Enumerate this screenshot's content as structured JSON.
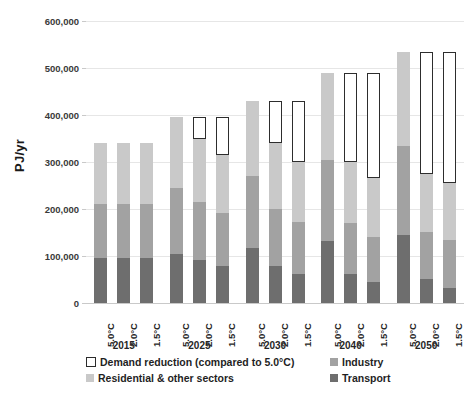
{
  "chart_data": {
    "type": "bar",
    "subtype": "stacked-bar-grouped",
    "title": "",
    "xlabel": "",
    "ylabel": "PJ/yr",
    "ylim": [
      0,
      600000
    ],
    "ytick_step": 100000,
    "ytick_labels": [
      "0",
      "100,000",
      "200,000",
      "300,000",
      "400,000",
      "500,000",
      "600,000"
    ],
    "ytick_values": [
      0,
      100000,
      200000,
      300000,
      400000,
      500000,
      600000
    ],
    "grid": true,
    "legend_position": "bottom",
    "legend": [
      "Demand reduction (compared to 5.0°C)",
      "Residential & other sectors",
      "Industry",
      "Transport"
    ],
    "series": [
      {
        "name": "Transport",
        "color": "#6e6e6e"
      },
      {
        "name": "Industry",
        "color": "#a2a2a2"
      },
      {
        "name": "Residential & other sectors",
        "color": "#c9c9c9"
      },
      {
        "name": "Demand reduction (compared to 5.0°C)",
        "color": "#ffffff"
      }
    ],
    "year_groups": [
      "2015",
      "2025",
      "2030",
      "2040",
      "2050"
    ],
    "scenarios": [
      "5.0°C",
      "2.0°C",
      "1.5°C"
    ],
    "bars": [
      {
        "year": "2015",
        "scenario": "5.0°C",
        "transport": 95000,
        "industry": 115000,
        "residential": 130000,
        "total": 340000,
        "reduction": 0
      },
      {
        "year": "2015",
        "scenario": "2.0°C",
        "transport": 95000,
        "industry": 115000,
        "residential": 130000,
        "total": 340000,
        "reduction": 0
      },
      {
        "year": "2015",
        "scenario": "1.5°C",
        "transport": 95000,
        "industry": 115000,
        "residential": 130000,
        "total": 340000,
        "reduction": 0
      },
      {
        "year": "2025",
        "scenario": "5.0°C",
        "transport": 105000,
        "industry": 140000,
        "residential": 150000,
        "total": 395000,
        "reduction": 0
      },
      {
        "year": "2025",
        "scenario": "2.0°C",
        "transport": 92000,
        "industry": 122000,
        "residential": 136000,
        "total": 350000,
        "reduction": 45000
      },
      {
        "year": "2025",
        "scenario": "1.5°C",
        "transport": 78000,
        "industry": 113000,
        "residential": 124000,
        "total": 315000,
        "reduction": 80000
      },
      {
        "year": "2030",
        "scenario": "5.0°C",
        "transport": 118000,
        "industry": 152000,
        "residential": 160000,
        "total": 430000,
        "reduction": 0
      },
      {
        "year": "2030",
        "scenario": "2.0°C",
        "transport": 78000,
        "industry": 122000,
        "residential": 140000,
        "total": 340000,
        "reduction": 90000
      },
      {
        "year": "2030",
        "scenario": "1.5°C",
        "transport": 62000,
        "industry": 110000,
        "residential": 128000,
        "total": 300000,
        "reduction": 130000
      },
      {
        "year": "2040",
        "scenario": "5.0°C",
        "transport": 133000,
        "industry": 172000,
        "residential": 185000,
        "total": 490000,
        "reduction": 0
      },
      {
        "year": "2040",
        "scenario": "2.0°C",
        "transport": 62000,
        "industry": 108000,
        "residential": 130000,
        "total": 300000,
        "reduction": 190000
      },
      {
        "year": "2040",
        "scenario": "1.5°C",
        "transport": 45000,
        "industry": 95000,
        "residential": 125000,
        "total": 265000,
        "reduction": 225000
      },
      {
        "year": "2050",
        "scenario": "5.0°C",
        "transport": 145000,
        "industry": 190000,
        "residential": 200000,
        "total": 535000,
        "reduction": 0
      },
      {
        "year": "2050",
        "scenario": "2.0°C",
        "transport": 52000,
        "industry": 100000,
        "residential": 123000,
        "total": 275000,
        "reduction": 260000
      },
      {
        "year": "2050",
        "scenario": "1.5°C",
        "transport": 32000,
        "industry": 103000,
        "residential": 120000,
        "total": 255000,
        "reduction": 280000
      }
    ]
  },
  "axis": {
    "y_title": "PJ/yr"
  },
  "legend": {
    "reduction": "Demand reduction (compared to 5.0°C)",
    "residential": "Residential & other sectors",
    "industry": "Industry",
    "transport": "Transport"
  }
}
